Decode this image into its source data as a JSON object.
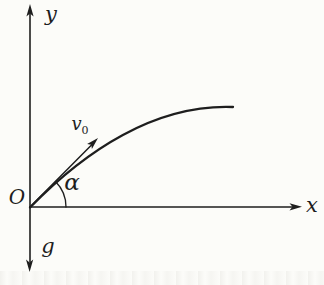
{
  "diagram": {
    "type": "projectile-motion-physics-diagram",
    "labels": {
      "y_axis": "y",
      "x_axis": "x",
      "origin": "O",
      "gravity": "g",
      "angle": "α",
      "initial_velocity": {
        "base": "v",
        "subscript": "0"
      }
    },
    "geometry_notes": {
      "launch_angle_deg": 45,
      "trajectory": "starts at origin tangent to v0 vector, flattens near apex at right end"
    },
    "colors": {
      "ink": "#1e1e1e",
      "background": "#fcfcf9"
    }
  }
}
